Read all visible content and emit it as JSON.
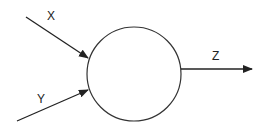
{
  "diagram": {
    "node": {
      "shape": "circle",
      "cx": 134,
      "cy": 74,
      "r": 47
    },
    "inputs": [
      {
        "label": "X",
        "x1": 26,
        "y1": 17,
        "x2": 88,
        "y2": 58,
        "label_x": 47,
        "label_y": 20
      },
      {
        "label": "Y",
        "x1": 17,
        "y1": 121,
        "x2": 88,
        "y2": 90,
        "label_x": 37,
        "label_y": 103
      }
    ],
    "output": {
      "label": "Z",
      "x1": 181,
      "y1": 69,
      "x2": 252,
      "y2": 69,
      "label_x": 212,
      "label_y": 60
    },
    "colors": {
      "stroke": "#222222",
      "background": "#ffffff"
    }
  }
}
